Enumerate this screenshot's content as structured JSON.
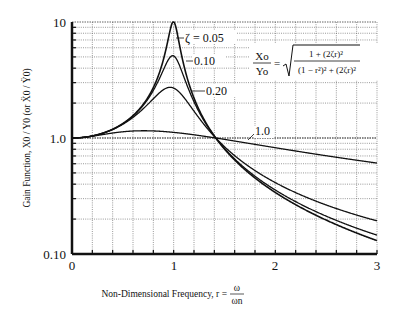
{
  "chart_data": {
    "type": "line",
    "title": "",
    "xlabel": "Non-Dimensional Frequency, r = ω/ωn",
    "xlabel_prefix": "Non-Dimensional Frequency, r =",
    "xlabel_frac_num": "ω",
    "xlabel_frac_den": "ωn",
    "ylabel": "Gain Function, X0 / Y0 (or Ẍ0 / Ÿ0)",
    "xlim": [
      0,
      3
    ],
    "ylim": [
      0.1,
      10
    ],
    "yscale": "log",
    "grid": true,
    "x_ticks": [
      "0",
      "1",
      "2",
      "3"
    ],
    "y_ticks": [
      "10",
      "1.0",
      "0.10"
    ],
    "formula": {
      "lhs_num": "Xo",
      "lhs_den": "Yo",
      "equals": "=",
      "rhs_num": "1 + (2ζr)²",
      "rhs_den": "(1 − r²)² + (2ζr)²"
    },
    "series": [
      {
        "name": "ζ = 0.05",
        "label": "ζ = 0.05",
        "zeta": 0.05,
        "x": [
          0,
          0.5,
          0.8,
          0.9,
          1.0,
          1.1,
          1.2,
          1.414,
          2.0,
          2.5,
          3.0
        ],
        "values": [
          1.0,
          1.33,
          2.77,
          5.24,
          10.05,
          4.7,
          2.25,
          1.0,
          0.34,
          0.2,
          0.13
        ]
      },
      {
        "name": "ζ = 0.10",
        "label": "0.10",
        "zeta": 0.1,
        "x": [
          0,
          0.5,
          0.8,
          0.9,
          1.0,
          1.1,
          1.2,
          1.414,
          2.0,
          2.5,
          3.0
        ],
        "values": [
          1.0,
          1.33,
          2.7,
          4.3,
          5.1,
          3.7,
          2.2,
          1.0,
          0.36,
          0.21,
          0.14
        ]
      },
      {
        "name": "ζ = 0.20",
        "label": "0.20",
        "zeta": 0.2,
        "x": [
          0,
          0.5,
          0.8,
          0.9,
          1.0,
          1.1,
          1.2,
          1.414,
          2.0,
          2.5,
          3.0
        ],
        "values": [
          1.0,
          1.32,
          2.37,
          2.71,
          2.69,
          2.36,
          1.87,
          1.0,
          0.42,
          0.26,
          0.19
        ]
      },
      {
        "name": "ζ = 1.0",
        "label": "1.0",
        "zeta": 1.0,
        "x": [
          0,
          0.5,
          0.8,
          1.0,
          1.414,
          2.0,
          2.5,
          3.0
        ],
        "values": [
          1.0,
          1.13,
          1.14,
          1.12,
          1.0,
          0.85,
          0.74,
          0.66
        ]
      }
    ]
  }
}
